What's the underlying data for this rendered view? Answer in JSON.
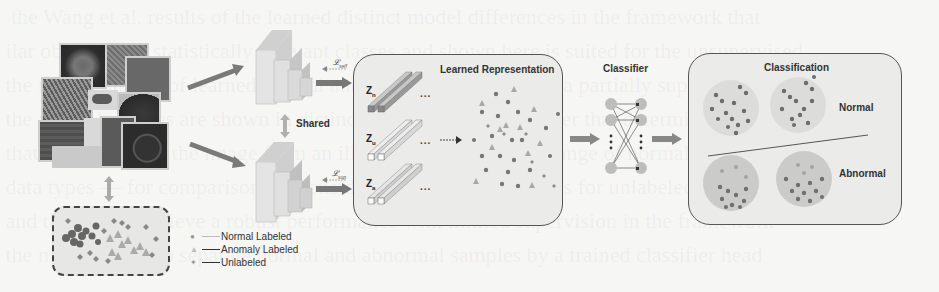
{
  "figure": {
    "input_images": {
      "label": "Input image collage",
      "count": 10
    },
    "latent_cluster_box": {
      "label": "Data distribution (t-SNE style)"
    },
    "encoders": {
      "shared_label": "Shared",
      "top_loss": "𝓛",
      "top_loss_sub": "self",
      "bottom_loss": "𝓛",
      "bottom_loss_sub": "sup"
    },
    "representation_panel": {
      "title": "Learned Representation",
      "rows": [
        {
          "symbol": "Z",
          "sub": "n",
          "ellipsis": "..."
        },
        {
          "symbol": "Z",
          "sub": "u",
          "ellipsis": "..."
        },
        {
          "symbol": "Z",
          "sub": "a",
          "ellipsis": "..."
        }
      ]
    },
    "classifier": {
      "title": "Classifier"
    },
    "classification_panel": {
      "title": "Classification",
      "normal_label": "Normal",
      "abnormal_label": "Abnormal"
    },
    "legend": [
      {
        "marker": "circle",
        "label": "Normal Labeled"
      },
      {
        "marker": "triangle",
        "label": "Anomaly Labeled"
      },
      {
        "marker": "diamond",
        "label": "Unlabeled"
      }
    ],
    "colors": {
      "arrow": "#777777",
      "panel_bg": "#ebebe9",
      "marker_dark": "#6e6e6e",
      "marker_light": "#a8a8a8",
      "cluster_normal": "#d9d9d7",
      "cluster_abnormal": "#c9c9c7"
    }
  }
}
